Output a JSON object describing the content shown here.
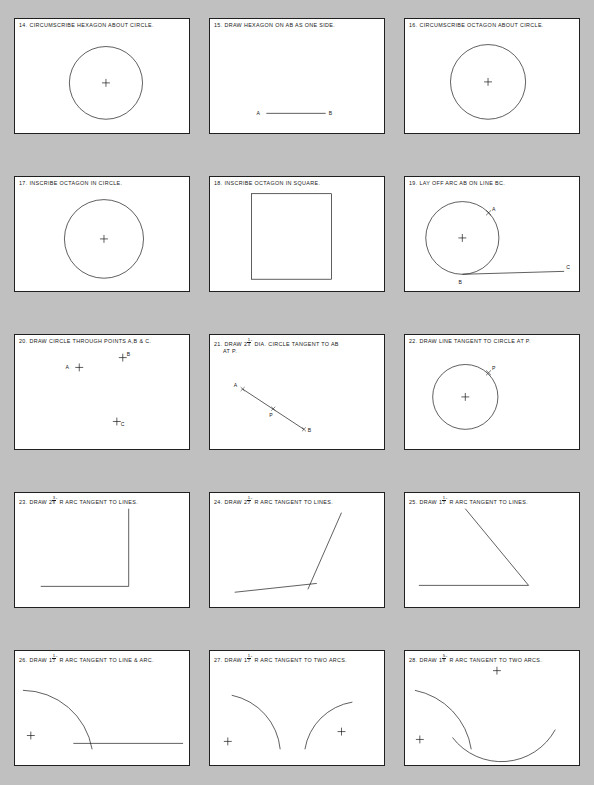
{
  "page": {
    "background_color": "#c0c0c0",
    "paper_color": "#ffffff",
    "ink_color": "#181818",
    "width": 594,
    "height": 785,
    "columns": 3,
    "rows": 5
  },
  "panels": [
    {
      "number": "14.",
      "title": "14. CIRCUMSCRIBE HEXAGON ABOUT CIRCLE.",
      "title_plain": "CIRCUMSCRIBE HEXAGON ABOUT CIRCLE.",
      "figure": "circle-with-center",
      "labels": []
    },
    {
      "number": "15.",
      "title": "15. DRAW HEXAGON ON AB AS ONE SIDE.",
      "title_plain": "DRAW HEXAGON ON AB AS ONE SIDE.",
      "figure": "segment-ab",
      "labels": [
        "A",
        "B"
      ]
    },
    {
      "number": "16.",
      "title": "16. CIRCUMSCRIBE OCTAGON ABOUT CIRCLE.",
      "title_plain": "CIRCUMSCRIBE OCTAGON ABOUT CIRCLE.",
      "figure": "circle-with-center",
      "labels": []
    },
    {
      "number": "17.",
      "title": "17. INSCRIBE OCTAGON IN CIRCLE.",
      "title_plain": "INSCRIBE OCTAGON IN CIRCLE.",
      "figure": "circle-with-center",
      "labels": []
    },
    {
      "number": "18.",
      "title": "18. INSCRIBE OCTAGON IN SQUARE.",
      "title_plain": "INSCRIBE OCTAGON IN SQUARE.",
      "figure": "square",
      "labels": []
    },
    {
      "number": "19.",
      "title": "19. LAY OFF ARC AB ON LINE BC.",
      "title_plain": "LAY OFF ARC AB ON LINE BC.",
      "figure": "circle-tangent-line-abc",
      "labels": [
        "A",
        "B",
        "C"
      ]
    },
    {
      "number": "20.",
      "title": "20. DRAW CIRCLE THROUGH POINTS A,B & C.",
      "title_plain": "DRAW CIRCLE THROUGH POINTS A,B & C.",
      "figure": "three-points",
      "labels": [
        "A",
        "B",
        "C"
      ]
    },
    {
      "number": "21.",
      "title_prefix": "21. DRAW 2",
      "fraction": {
        "numerator": "1",
        "denominator": "4"
      },
      "unit": "\"",
      "title_suffix": " DIA. CIRCLE TANGENT TO AB",
      "title_line2": "AT P.",
      "title_plain": "21. DRAW 2 1/4\" DIA. CIRCLE TANGENT TO AB AT P.",
      "figure": "oblique-segment-apb",
      "labels": [
        "A",
        "P",
        "B"
      ]
    },
    {
      "number": "22.",
      "title": "22. DRAW LINE TANGENT TO CIRCLE AT P.",
      "title_plain": "DRAW LINE TANGENT TO CIRCLE AT P.",
      "figure": "circle-point-p",
      "labels": [
        "P"
      ]
    },
    {
      "number": "23.",
      "title_prefix": "23. DRAW 2",
      "fraction": {
        "numerator": "3",
        "denominator": "8"
      },
      "unit": "\"",
      "title_suffix": " R ARC TANGENT TO LINES.",
      "title_plain": "23. DRAW 2 3/8\" R ARC TANGENT TO LINES.",
      "figure": "right-angle-lines",
      "labels": []
    },
    {
      "number": "24.",
      "title_prefix": "24. DRAW 2",
      "fraction": {
        "numerator": "1",
        "denominator": "2"
      },
      "unit": "\"",
      "title_suffix": " R ARC TANGENT TO LINES.",
      "title_plain": "24. DRAW 2 1/2\" R ARC TANGENT TO LINES.",
      "figure": "acute-angle-lines",
      "labels": []
    },
    {
      "number": "25.",
      "title_prefix": "25. DRAW 1",
      "fraction": {
        "numerator": "1",
        "denominator": "2"
      },
      "unit": "\"",
      "title_suffix": " R ARC TANGENT TO LINES.",
      "title_plain": "25. DRAW 1 1/2\" R ARC TANGENT TO LINES.",
      "figure": "obtuse-angle-lines",
      "labels": []
    },
    {
      "number": "26.",
      "title_prefix": "26. DRAW 1",
      "fraction": {
        "numerator": "1",
        "denominator": "2"
      },
      "unit": "\"",
      "title_suffix": " R ARC TANGENT TO LINE & ARC.",
      "title_plain": "26. DRAW 1 1/2\" R ARC TANGENT TO LINE & ARC.",
      "figure": "arc-and-line",
      "labels": []
    },
    {
      "number": "27.",
      "title_prefix": "27. DRAW 1",
      "fraction": {
        "numerator": "1",
        "denominator": "2"
      },
      "unit": "\"",
      "title_suffix": " R ARC TANGENT TO TWO ARCS.",
      "title_plain": "27. DRAW 1 1/2\" R ARC TANGENT TO TWO ARCS.",
      "figure": "two-arcs-facing",
      "labels": []
    },
    {
      "number": "28.",
      "title_prefix": "28. DRAW 1",
      "fraction": {
        "numerator": "5",
        "denominator": "8"
      },
      "unit": "\"",
      "title_suffix": " R ARC TANGENT TO TWO ARCS.",
      "title_plain": "28. DRAW 1 5/8\" R ARC TANGENT TO TWO ARCS.",
      "figure": "two-arcs-offset",
      "labels": []
    }
  ]
}
